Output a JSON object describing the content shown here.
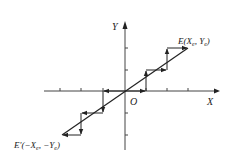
{
  "diagram": {
    "type": "linear-interpolation-staircase",
    "axes": {
      "x_label": "X",
      "y_label": "Y",
      "origin_label": "O"
    },
    "endpoints": {
      "end": {
        "label": "E(X",
        "sub1": "e",
        "mid": ", Y",
        "sub2": "e",
        "close": ")"
      },
      "start": {
        "label": "E'(−X",
        "sub1": "e",
        "mid": ", −Y",
        "sub2": "e",
        "close": ")"
      }
    },
    "colors": {
      "line": "#222222",
      "background": "#ffffff"
    }
  }
}
